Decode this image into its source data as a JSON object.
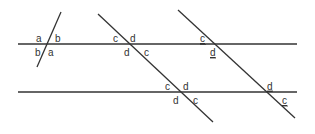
{
  "diagram": {
    "lines": {
      "parallel_top": {
        "x1": 18,
        "y1": 44,
        "x2": 297,
        "y2": 44
      },
      "parallel_bottom": {
        "x1": 18,
        "y1": 92,
        "x2": 297,
        "y2": 92
      },
      "transversal_short": {
        "x1": 61,
        "y1": 12,
        "x2": 37,
        "y2": 67
      },
      "transversal_middle": {
        "x1": 98,
        "y1": 14,
        "x2": 213,
        "y2": 122
      },
      "transversal_right": {
        "x1": 178,
        "y1": 10,
        "x2": 295,
        "y2": 118
      }
    },
    "labels": {
      "short_top_left": "a",
      "short_top_right": "b",
      "short_bottom_left": "b",
      "short_bottom_right": "a",
      "mid_top_upper_left": "c",
      "mid_top_upper_right": "d",
      "mid_top_lower_left": "d",
      "mid_top_lower_right": "c",
      "mid_bot_upper_left": "c",
      "mid_bot_upper_right": "d",
      "mid_bot_lower_left": "d",
      "mid_bot_lower_right": "c",
      "right_top_upper_left": "c",
      "right_top_lower_left": "d",
      "right_bot_upper_left": "d",
      "right_bot_lower_right": "c"
    },
    "underlined_labels": [
      "right_top_upper_left",
      "right_top_lower_left",
      "right_bot_upper_left",
      "right_bot_lower_right"
    ],
    "line_color": "#333333"
  }
}
